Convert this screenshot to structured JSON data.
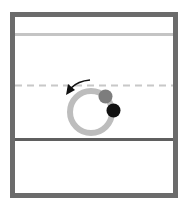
{
  "diagram": {
    "type": "pool-table-like schematic",
    "frame_color": "#6b6b6b",
    "top_line_color": "#c4c4c4",
    "dashed_line_color": "#c4c4c4",
    "divider_line_color": "#5f5f5f",
    "ring_color": "#bdbdbd",
    "gray_ball_color": "#7d7d7d",
    "black_ball_color": "#111111",
    "arrow_color": "#111111",
    "arrow_direction": "counter-clockwise"
  }
}
